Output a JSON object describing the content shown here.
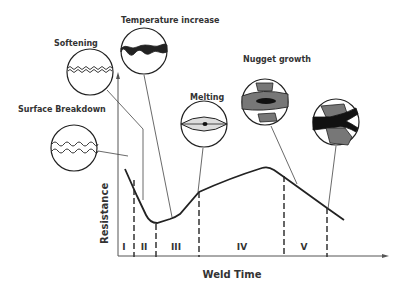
{
  "diagram": {
    "x_axis_label": "Weld Time",
    "y_axis_label": "Resistance",
    "stages": [
      {
        "id": "I",
        "label": "Surface Breakdown"
      },
      {
        "id": "II",
        "label": "Softening"
      },
      {
        "id": "III",
        "label": "Temperature increase"
      },
      {
        "id": "IV",
        "label": "Melting"
      },
      {
        "id": "V",
        "label": "Nugget growth"
      }
    ],
    "regions": [
      "I",
      "II",
      "III",
      "IV",
      "V"
    ],
    "callouts": {
      "surface_breakdown": "Surface Breakdown",
      "softening": "Softening",
      "temperature_increase": "Temperature increase",
      "melting": "Melting",
      "nugget_growth": "Nugget growth",
      "expulsion": ""
    },
    "colors": {
      "line": "#222222",
      "grey_fill": "#777777",
      "light_fill": "#dddddd",
      "black_fill": "#111111"
    }
  }
}
